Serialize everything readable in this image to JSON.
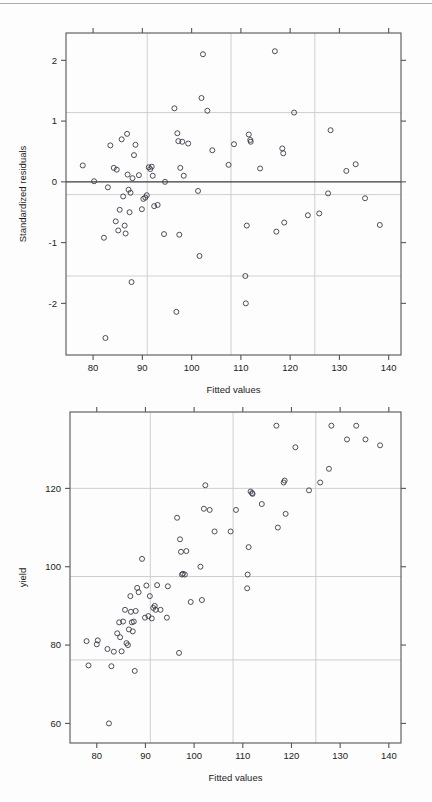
{
  "page": {
    "background_color": "#fdfdfd",
    "width": 432,
    "height": 802
  },
  "figures": [
    {
      "id": "residuals-plot",
      "title": ""
    },
    {
      "id": "yield-plot",
      "title": ""
    }
  ],
  "chart_data": [
    {
      "id": "residuals-plot",
      "type": "scatter",
      "title": "",
      "xlabel": "Fitted values",
      "ylabel": "Standardized residuals",
      "xlim": [
        74.5,
        142.5
      ],
      "ylim": [
        -2.85,
        2.45
      ],
      "xticks": [
        80,
        90,
        100,
        110,
        120,
        130,
        140
      ],
      "yticks": [
        -2,
        -1,
        0,
        1,
        2
      ],
      "xtick_labels": [
        "80",
        "90",
        "100",
        "110",
        "120",
        "130",
        "140"
      ],
      "ytick_labels": [
        "-2",
        "-1",
        "0",
        "1",
        "2"
      ],
      "grid": true,
      "grid_color": "#c9c9c9",
      "vertical_gridlines": [
        91,
        108,
        125
      ],
      "horizontal_gridlines": [
        1.14,
        -0.21,
        -1.55
      ],
      "reference_line": {
        "y": 0,
        "color": "#3a3a3a",
        "label": "zero-residual line"
      },
      "legend": null,
      "marker": "open-circle",
      "marker_color": "#3b3b4a",
      "x": [
        77.9,
        80.2,
        82.2,
        82.5,
        83.0,
        83.5,
        84.2,
        84.6,
        84.8,
        85.1,
        85.4,
        85.8,
        86.1,
        86.4,
        86.6,
        86.9,
        87.0,
        87.2,
        87.4,
        87.6,
        87.8,
        88.0,
        88.3,
        88.6,
        89.3,
        89.9,
        90.2,
        90.6,
        90.9,
        91.3,
        91.6,
        91.9,
        92.1,
        92.4,
        93.1,
        94.4,
        94.6,
        96.5,
        96.9,
        97.1,
        97.3,
        97.5,
        97.7,
        98.1,
        98.4,
        99.3,
        101.3,
        101.6,
        102.0,
        102.3,
        103.2,
        104.2,
        107.5,
        108.6,
        110.9,
        111.0,
        111.2,
        111.6,
        111.9,
        112.0,
        113.9,
        116.9,
        117.2,
        118.4,
        118.6,
        118.8,
        120.8,
        123.6,
        125.9,
        127.7,
        128.2,
        131.4,
        133.3,
        135.2,
        138.2
      ],
      "y": [
        0.27,
        0.01,
        -0.92,
        -2.57,
        -0.09,
        0.6,
        0.23,
        -0.65,
        0.2,
        -0.8,
        -0.46,
        0.7,
        -0.24,
        -0.72,
        -0.85,
        0.79,
        0.12,
        -0.13,
        -0.5,
        -0.18,
        -1.65,
        0.06,
        0.44,
        0.61,
        0.11,
        -0.45,
        -0.28,
        -0.26,
        -0.22,
        0.24,
        0.21,
        0.25,
        0.1,
        -0.4,
        -0.38,
        -0.86,
        0.0,
        1.21,
        -2.14,
        0.8,
        0.67,
        -0.87,
        0.23,
        0.66,
        0.1,
        0.63,
        -0.15,
        -1.22,
        1.38,
        2.1,
        1.17,
        0.52,
        0.28,
        0.62,
        -1.55,
        -2.0,
        -0.72,
        0.78,
        0.69,
        0.66,
        0.22,
        2.15,
        -0.82,
        0.55,
        0.47,
        -0.67,
        1.14,
        -0.55,
        -0.52,
        -0.19,
        0.85,
        0.18,
        0.29,
        -0.27,
        -0.71
      ]
    },
    {
      "id": "yield-plot",
      "type": "scatter",
      "title": "",
      "xlabel": "Fitted values",
      "ylabel": "yield",
      "xlim": [
        74.5,
        142.5
      ],
      "ylim": [
        55.0,
        139.5
      ],
      "xticks": [
        80,
        90,
        100,
        110,
        120,
        130,
        140
      ],
      "yticks": [
        60,
        80,
        100,
        120
      ],
      "xtick_labels": [
        "80",
        "90",
        "100",
        "110",
        "120",
        "130",
        "140"
      ],
      "ytick_labels": [
        "60",
        "80",
        "100",
        "120"
      ],
      "grid": true,
      "grid_color": "#c9c9c9",
      "vertical_gridlines": [
        91,
        108,
        125
      ],
      "horizontal_gridlines": [
        120,
        97.5,
        76.2
      ],
      "reference_line": null,
      "legend": null,
      "marker": "open-circle",
      "marker_color": "#3b3b4a",
      "x": [
        77.9,
        78.3,
        80.0,
        80.2,
        82.2,
        82.5,
        83.0,
        83.5,
        84.2,
        84.6,
        84.8,
        85.1,
        85.4,
        85.8,
        86.1,
        86.4,
        86.6,
        86.9,
        87.0,
        87.2,
        87.4,
        87.6,
        87.8,
        88.0,
        88.3,
        88.6,
        89.3,
        89.9,
        90.2,
        90.6,
        90.9,
        91.3,
        91.6,
        91.9,
        92.1,
        92.4,
        93.1,
        94.4,
        94.6,
        96.5,
        96.9,
        97.1,
        97.3,
        97.5,
        97.7,
        98.1,
        98.4,
        99.3,
        101.3,
        101.6,
        102.0,
        102.3,
        103.2,
        104.2,
        107.5,
        108.6,
        110.9,
        111.0,
        111.2,
        111.6,
        111.9,
        112.0,
        113.9,
        116.9,
        117.2,
        118.4,
        118.6,
        118.8,
        120.8,
        123.6,
        125.9,
        127.7,
        128.2,
        131.4,
        133.3,
        135.2,
        138.2
      ],
      "y": [
        81.0,
        74.8,
        80.2,
        81.2,
        79.0,
        60.0,
        74.6,
        78.3,
        83.0,
        85.8,
        82.0,
        78.4,
        86.0,
        89.0,
        80.5,
        80.0,
        84.0,
        92.5,
        88.5,
        85.8,
        83.5,
        86.0,
        73.4,
        88.7,
        94.6,
        93.5,
        102.0,
        87.0,
        95.2,
        87.4,
        92.5,
        86.8,
        89.5,
        90.0,
        89.0,
        95.3,
        89.0,
        87.0,
        95.0,
        112.5,
        78.0,
        107.0,
        103.8,
        98.0,
        98.2,
        98.0,
        104.0,
        91.0,
        100.0,
        91.5,
        114.8,
        120.8,
        114.5,
        109.0,
        109.0,
        114.5,
        94.5,
        98.0,
        105.0,
        119.2,
        118.8,
        118.6,
        116.0,
        136.0,
        110.0,
        121.5,
        122.0,
        113.5,
        130.5,
        119.5,
        121.5,
        125.0,
        136.0,
        132.5,
        136.0,
        132.5,
        131.0
      ]
    }
  ]
}
